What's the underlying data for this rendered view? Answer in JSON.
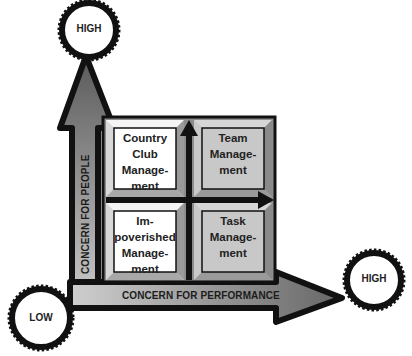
{
  "diagram": {
    "type": "managerial-grid",
    "axes": {
      "y": {
        "label": "CONCERN FOR PEOPLE",
        "high_label": "HIGH"
      },
      "x": {
        "label": "CONCERN FOR PERFORMANCE",
        "high_label": "HIGH"
      },
      "origin_label": "LOW"
    },
    "quadrants": [
      {
        "position": "top-left",
        "text": "Country\nClub\nManage-\nment",
        "fill": "#ffffff"
      },
      {
        "position": "top-right",
        "text": "Team\nManage-\nment",
        "fill": "#c8c8c8"
      },
      {
        "position": "bottom-left",
        "text": "Im-\npoverished\nManage-\nment",
        "fill": "#ffffff"
      },
      {
        "position": "bottom-right",
        "text": "Task\nManage-\nment",
        "fill": "#c8c8c8"
      }
    ],
    "colors": {
      "outline": "#111111",
      "arrow_dark": "#6e6e6e",
      "arrow_light": "#c4c4c4",
      "tile_grey": "#c8c8c8",
      "tile_white": "#ffffff"
    }
  }
}
